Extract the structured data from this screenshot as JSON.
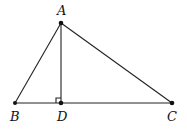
{
  "diagram": {
    "type": "triangle-with-altitude",
    "points": {
      "A": {
        "label": "A",
        "x": 61,
        "y": 23,
        "label_x": 57,
        "label_y": 15
      },
      "B": {
        "label": "B",
        "x": 15,
        "y": 103,
        "label_x": 10,
        "label_y": 121
      },
      "D": {
        "label": "D",
        "x": 61,
        "y": 103,
        "label_x": 57,
        "label_y": 121
      },
      "C": {
        "label": "C",
        "x": 172,
        "y": 103,
        "label_x": 167,
        "label_y": 121
      }
    },
    "segments": [
      {
        "name": "AB",
        "from": "A",
        "to": "B"
      },
      {
        "name": "AC",
        "from": "A",
        "to": "C"
      },
      {
        "name": "BC",
        "from": "B",
        "to": "C"
      },
      {
        "name": "AD",
        "from": "A",
        "to": "D"
      }
    ],
    "right_angle": {
      "at": "D",
      "size": 5
    },
    "colors": {
      "line": "#222222",
      "point": "#111111",
      "background": "#ffffff"
    }
  }
}
